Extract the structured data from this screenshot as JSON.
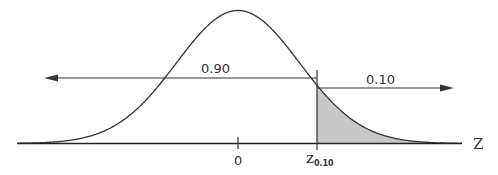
{
  "chart_data": {
    "type": "area",
    "title": "",
    "xlabel": "Z",
    "ylabel": "",
    "x_ticks": [
      {
        "value": 0,
        "label": "0"
      },
      {
        "value": 1.28,
        "label": "z0.10",
        "main": "z",
        "subscript": "0.10"
      }
    ],
    "curve": {
      "distribution": "normal",
      "mean": 0,
      "sd": 1
    },
    "shaded_region": {
      "from": 1.28,
      "to": "inf",
      "area": 0.1,
      "color": "#c8c8c8"
    },
    "annotations": [
      {
        "text": "0.90",
        "arrow": "left",
        "meaning": "area to the left of z0.10"
      },
      {
        "text": "0.10",
        "arrow": "right",
        "meaning": "area to the right of z0.10"
      }
    ],
    "grid": false,
    "legend": null
  },
  "labels": {
    "left_area": "0.90",
    "right_area": "0.10",
    "axis_name": "Z",
    "tick_zero": "0",
    "tick_z_main": "z",
    "tick_z_sub": "0.10"
  },
  "colors": {
    "line": "#333333",
    "shade": "#c8c8c8"
  }
}
